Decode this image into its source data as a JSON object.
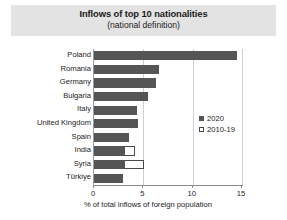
{
  "chart_data": {
    "type": "bar",
    "orientation": "horizontal",
    "title": "Inflows of top 10 nationalities",
    "subtitle": "(national definition)",
    "xlabel": "% of total inflows of foreign population",
    "ylabel": "",
    "xlim": [
      0,
      15.2
    ],
    "xticks": [
      0,
      5,
      10,
      15
    ],
    "xtick_labels": [
      "0",
      "5",
      "10",
      "15"
    ],
    "grid": true,
    "legend_position": "center-right",
    "categories": [
      "Poland",
      "Romania",
      "Germany",
      "Bulgaria",
      "Italy",
      "United Kingdom",
      "Spain",
      "India",
      "Syria",
      "Türkiye"
    ],
    "series": [
      {
        "name": "2020",
        "style": "filled",
        "color": "#555555",
        "values": [
          14.5,
          6.6,
          6.3,
          5.5,
          4.4,
          4.5,
          3.5,
          3.1,
          3.1,
          2.9
        ]
      },
      {
        "name": "2010-19",
        "style": "hollow",
        "color": "#ffffff",
        "values": [
          null,
          null,
          null,
          null,
          null,
          null,
          null,
          4.2,
          5.1,
          null
        ]
      }
    ]
  },
  "legend": {
    "items": [
      {
        "label": "2020",
        "style": "filled"
      },
      {
        "label": "2010-19",
        "style": "hollow"
      }
    ]
  },
  "colors": {
    "series_2020": "#555555",
    "series_2010_19": "#ffffff",
    "title_band": "#e3e3e3",
    "axis": "#8c8c8c",
    "grid": "#cfcfcf"
  }
}
